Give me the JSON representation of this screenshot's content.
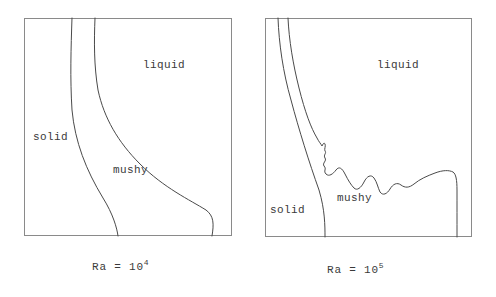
{
  "figure": {
    "type": "scientific-diagram",
    "stroke_color": "#4a4a4a",
    "frame_color": "#8a8a8a",
    "background_color": "#ffffff"
  },
  "panels": [
    {
      "id": "ra4",
      "caption_prefix": "Ra = 10",
      "caption_exponent": "4",
      "caption_full": "Ra = 10^4",
      "labels": {
        "liquid": "liquid",
        "solid": "solid",
        "mushy": "mushy"
      },
      "interface_style": "smooth",
      "curves": [
        {
          "name": "solid-mushy-boundary",
          "description": "smooth near-vertical curve bowing slightly right toward the base",
          "points": "M 48,0 C 47,30 46,60 48,92 C 51,124 62,152 79,180 C 89,196 93,210 94,218"
        },
        {
          "name": "mushy-liquid-boundary",
          "description": "smooth curve sweeping right and bulging out before returning to the base",
          "points": "M 71,0 C 70,24 70,48 74,72 C 80,100 94,124 116,146 C 140,170 166,182 182,192 C 190,198 190,206 188,218"
        }
      ]
    },
    {
      "id": "ra5",
      "caption_prefix": "Ra = 10",
      "caption_exponent": "5",
      "caption_full": "Ra = 10^5",
      "labels": {
        "liquid": "liquid",
        "solid": "solid",
        "mushy": "mushy"
      },
      "interface_style": "dendritic-wavy",
      "curves": [
        {
          "name": "solid-mushy-boundary",
          "description": "steep curve from top-left sweeping down-right to the base",
          "points": "M 13,0 C 14,26 18,54 26,82 C 34,112 44,144 54,172 C 60,192 60,208 60,219"
        },
        {
          "name": "mushy-liquid-boundary",
          "description": "smooth upper segment then strongly wavy dendritic interface then rise to a plateau and steep drop at the right wall",
          "points": "M 23,0 C 24,22 28,46 34,70 C 40,94 46,110 52,120 C 54,124 56,126 57,128 C 58,126 59,124 60,126 C 61,128 59,131 60,133 C 62,135 58,137 60,140 C 62,143 57,145 59,148 C 62,151 58,153 61,156 C 64,159 68,156 71,152 C 74,148 77,150 80,156 C 83,162 86,167 89,170 C 92,173 96,170 99,164 C 102,158 106,156 109,160 C 112,164 113,170 115,174 C 118,178 122,176 125,171 C 128,166 132,164 136,167 C 140,170 144,170 149,166 C 155,161 162,158 170,155 C 178,152 184,152 188,154 C 191,156 192,162 192,172 C 192,186 192,202 192,219"
        }
      ]
    }
  ]
}
